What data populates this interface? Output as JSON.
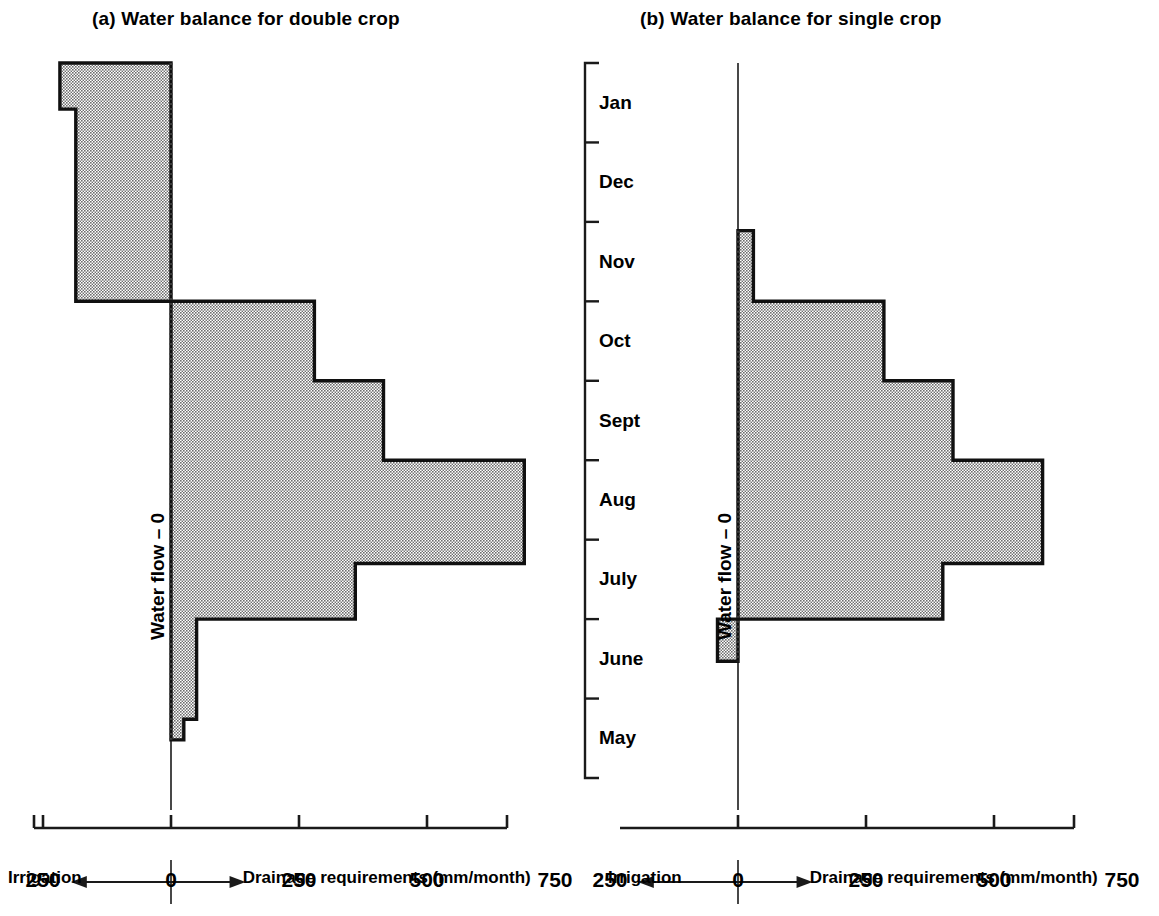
{
  "figure": {
    "months": [
      "Jan",
      "Dec",
      "Nov",
      "Oct",
      "Sept",
      "Aug",
      "July",
      "June",
      "May"
    ],
    "x_tick_labels": [
      "250",
      "0",
      "250",
      "500",
      "750"
    ],
    "x_tick_values": [
      -250,
      0,
      250,
      500,
      750
    ],
    "axis_left_label": "Irrigation",
    "axis_right_label": "Drainage requirements (mm/month)",
    "axis_arrow_left": "←",
    "axis_arrow_right": "→",
    "zero_axis_label": "Water flow – 0",
    "colors": {
      "fill": "#9a9a9a",
      "outline": "#101010",
      "axis": "#1a1a1a",
      "background": "#ffffff"
    }
  },
  "panels": [
    {
      "key": "a",
      "title": "(a)  Water balance for double crop",
      "title_prefix": "(a)",
      "title_text": "Water balance for double crop"
    },
    {
      "key": "b",
      "title": "(b)  Water balance for single crop",
      "title_prefix": "(b)",
      "title_text": "Water balance for single crop"
    }
  ],
  "chart_data": [
    {
      "type": "bar",
      "orientation": "horizontal",
      "title": "(a)  Water balance for double crop",
      "xlabel": "Drainage requirements (mm/month)",
      "ylabel": "Water flow – 0",
      "xlim": [
        -257,
        760
      ],
      "xticks": [
        -250,
        0,
        250,
        500,
        750
      ],
      "xticklabels": [
        "250",
        "0",
        "250",
        "500",
        "750"
      ],
      "categories": [
        "Jan",
        "Dec",
        "Nov",
        "Oct",
        "Sept",
        "Aug",
        "July",
        "June",
        "May"
      ],
      "values": [
        -217,
        -186,
        -186,
        280,
        415,
        690,
        690,
        50,
        25
      ],
      "negative_means": "Irrigation",
      "positive_means": "Drainage requirements",
      "grid": false,
      "legend": null,
      "notes": "Step profile; Jan bar starts at top of Jan band; July band is split: upper portion 690, lower portion 360; May band bar is a short stub ~25 occupying lower part of band."
    },
    {
      "type": "bar",
      "orientation": "horizontal",
      "title": "(b)  Water balance for single crop",
      "xlabel": "Drainage requirements (mm/month)",
      "ylabel": "Water flow – 0",
      "xlim": [
        -257,
        760
      ],
      "xticks": [
        -250,
        0,
        250,
        500,
        750
      ],
      "xticklabels": [
        "250",
        "0",
        "250",
        "500",
        "750"
      ],
      "categories": [
        "Jan",
        "Dec",
        "Nov",
        "Oct",
        "Sept",
        "Aug",
        "July",
        "June",
        "May"
      ],
      "values": [
        0,
        0,
        30,
        285,
        420,
        595,
        595,
        -40,
        0
      ],
      "negative_means": "Irrigation",
      "positive_means": "Drainage requirements",
      "grid": false,
      "legend": null,
      "notes": "Step profile begins partway into the Nov band; July band split: upper 595, lower 400; June band has small negative (irrigation) bar of about -40."
    }
  ]
}
